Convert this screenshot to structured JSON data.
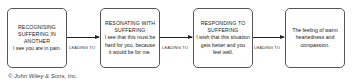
{
  "diagram": {
    "nodes": [
      {
        "heading": "RECOGNISING SUFFERING IN ANOTHER",
        "text": "I see you are in pain."
      },
      {
        "heading": "RESONATING WITH SUFFERING",
        "text": "I see that this must be hard for you, because it would be for me."
      },
      {
        "heading": "RESPONDING TO SUFFERING",
        "text": "I wish that this situation gets better and you feel well."
      },
      {
        "heading": "",
        "text": "The feeling of warm heartedness and compassion."
      }
    ],
    "edges": [
      {
        "label": "LEADING TO"
      },
      {
        "label": "LEADING TO"
      },
      {
        "label": "LEADING TO"
      }
    ]
  },
  "copyright": "© John Wiley & Sons, Inc."
}
